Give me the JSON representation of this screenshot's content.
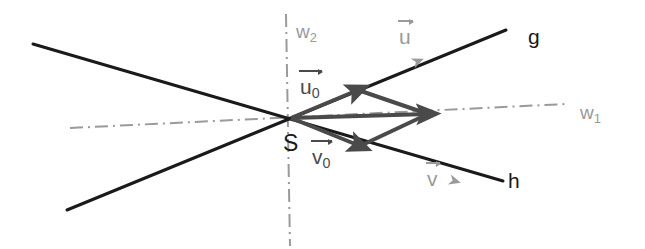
{
  "figure": {
    "type": "geometry-diagram",
    "width": 645,
    "height": 249,
    "background": "#ffffff"
  },
  "colors": {
    "line_dark": "#1a1a1a",
    "vector_dark": "#4a4a4a",
    "gray": "#9a9a9a",
    "dashdot": "#9a9a9a"
  },
  "points": {
    "S": {
      "x": 291,
      "y": 118,
      "label": "S",
      "label_x": 283,
      "label_y": 132
    }
  },
  "lines": [
    {
      "name": "g",
      "label": "g",
      "label_x": 528,
      "label_y": 26,
      "x1": 67,
      "y1": 210,
      "x2": 506,
      "y2": 30,
      "color": "#1a1a1a",
      "width": 3
    },
    {
      "name": "h",
      "label": "h",
      "label_x": 508,
      "label_y": 170,
      "x1": 33,
      "y1": 44,
      "x2": 503,
      "y2": 181,
      "color": "#1a1a1a",
      "width": 3
    },
    {
      "name": "w1",
      "label": "w",
      "label_sub": "1",
      "label_x": 580,
      "label_y": 103,
      "x1": 70,
      "y1": 128,
      "x2": 566,
      "y2": 104,
      "color": "#9a9a9a",
      "width": 2,
      "style": "dash-dot"
    },
    {
      "name": "w2",
      "label": "w",
      "label_sub": "2",
      "label_x": 296,
      "label_y": 22,
      "x1": 286,
      "y1": 14,
      "x2": 290,
      "y2": 246,
      "color": "#9a9a9a",
      "width": 2,
      "style": "dash-dot"
    }
  ],
  "vectors": [
    {
      "name": "u0",
      "label": "u",
      "label_sub": "0",
      "label_x": 300,
      "label_y": 76,
      "from_x": 291,
      "from_y": 118,
      "to_x": 358,
      "to_y": 90,
      "color": "#4a4a4a",
      "width": 4
    },
    {
      "name": "v0",
      "label": "v",
      "label_sub": "0",
      "label_x": 312,
      "label_y": 146,
      "from_x": 291,
      "from_y": 118,
      "to_x": 360,
      "to_y": 146,
      "color": "#4a4a4a",
      "width": 4
    },
    {
      "name": "sum",
      "label": "",
      "from_x": 291,
      "from_y": 118,
      "to_x": 428,
      "to_y": 114,
      "color": "#4a4a4a",
      "width": 4
    },
    {
      "name": "u0-parallel",
      "from_x": 360,
      "from_y": 146,
      "to_x": 428,
      "to_y": 114,
      "color": "#4a4a4a",
      "width": 4,
      "arrow": false
    },
    {
      "name": "v0-parallel",
      "from_x": 358,
      "from_y": 90,
      "to_x": 428,
      "to_y": 114,
      "color": "#4a4a4a",
      "width": 4,
      "arrow": false
    }
  ],
  "direction_markers": [
    {
      "name": "u",
      "label": "u",
      "label_x": 399,
      "label_y": 26,
      "at_x": 421,
      "at_y": 60,
      "angle_deg": -22.3,
      "color": "#9a9a9a"
    },
    {
      "name": "v",
      "label": "v",
      "label_x": 427,
      "label_y": 168,
      "at_x": 458,
      "at_y": 182,
      "angle_deg": 16.3,
      "color": "#9a9a9a"
    }
  ]
}
